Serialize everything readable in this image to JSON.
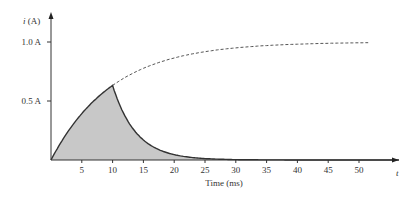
{
  "chart_data": {
    "type": "area",
    "title": "",
    "xlabel": "Time (ms)",
    "ylabel": "i (A)",
    "x_axis_end_label": "t",
    "xticks": [
      5,
      10,
      15,
      20,
      25,
      30,
      35,
      40,
      45,
      50
    ],
    "yticks": [
      {
        "value": 0.5,
        "label": "0.5 A"
      },
      {
        "value": 1.0,
        "label": "1.0 A"
      }
    ],
    "xlim": [
      0,
      56
    ],
    "ylim": [
      0,
      1.25
    ],
    "grid": false,
    "legend": null,
    "series": [
      {
        "name": "Rise (charging) 0–10 ms",
        "style": "solid, shaded below",
        "x": [
          0,
          2,
          4,
          6,
          8,
          10
        ],
        "y": [
          0,
          0.18,
          0.33,
          0.45,
          0.55,
          0.632
        ]
      },
      {
        "name": "Decay after 10 ms",
        "style": "solid, shaded below",
        "x": [
          10,
          12,
          15,
          20,
          25,
          30,
          40,
          50,
          57
        ],
        "y": [
          0.632,
          0.38,
          0.19,
          0.05,
          0.015,
          0.004,
          0.0,
          0.0,
          0.0
        ]
      },
      {
        "name": "Continued rise (if not switched)",
        "style": "dashed",
        "x": [
          10,
          15,
          20,
          25,
          30,
          35,
          40,
          45,
          50
        ],
        "y": [
          0.632,
          0.777,
          0.865,
          0.918,
          0.95,
          0.97,
          0.982,
          0.989,
          0.993
        ]
      }
    ]
  },
  "axes": {
    "y_title": "i (A)",
    "x_title": "Time (ms)",
    "x_end": "t"
  }
}
